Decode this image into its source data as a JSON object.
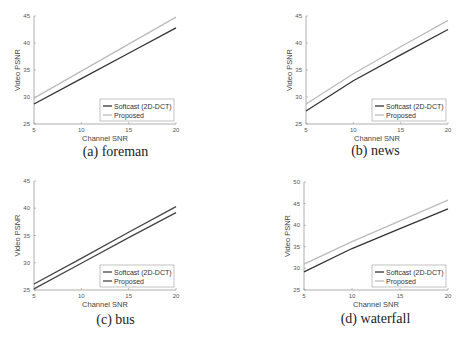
{
  "chart_data": [
    {
      "type": "line",
      "caption": "(a) foreman",
      "xlabel": "Channel SNR",
      "ylabel": "Video PSNR",
      "xlim": [
        5,
        20
      ],
      "ylim": [
        25,
        45
      ],
      "xticks": [
        5,
        10,
        15,
        20
      ],
      "yticks": [
        25,
        30,
        35,
        40,
        45
      ],
      "grid": false,
      "legend_position": "lower right",
      "x": [
        5,
        10,
        15,
        20
      ],
      "series": [
        {
          "name": "Softcast (2D-DCT)",
          "color": "#333333",
          "values": [
            28.7,
            33.4,
            38.1,
            42.8
          ]
        },
        {
          "name": "Proposed",
          "color": "#bbbbbb",
          "values": [
            29.8,
            34.8,
            39.8,
            44.8
          ]
        }
      ]
    },
    {
      "type": "line",
      "caption": "(b) news",
      "xlabel": "Channel SNR",
      "ylabel": "Video PSNR",
      "xlim": [
        5,
        20
      ],
      "ylim": [
        25,
        45
      ],
      "xticks": [
        5,
        10,
        15,
        20
      ],
      "yticks": [
        25,
        30,
        35,
        40,
        45
      ],
      "grid": false,
      "legend_position": "lower right",
      "x": [
        5,
        10,
        15,
        20
      ],
      "series": [
        {
          "name": "Softcast (2D-DCT)",
          "color": "#333333",
          "values": [
            27.4,
            33.0,
            37.8,
            42.5
          ]
        },
        {
          "name": "Proposed",
          "color": "#bbbbbb",
          "values": [
            28.7,
            34.3,
            39.3,
            44.2
          ]
        }
      ]
    },
    {
      "type": "line",
      "caption": "(c) bus",
      "xlabel": "Channel SNR",
      "ylabel": "Video PSNR",
      "xlim": [
        5,
        20
      ],
      "ylim": [
        25,
        45
      ],
      "xticks": [
        5,
        10,
        15,
        20
      ],
      "yticks": [
        25,
        30,
        35,
        40,
        45
      ],
      "grid": false,
      "legend_position": "lower right",
      "x": [
        5,
        10,
        15,
        20
      ],
      "series": [
        {
          "name": "Softcast (2D-DCT)",
          "color": "#444444",
          "values": [
            26.1,
            30.8,
            35.6,
            40.3
          ]
        },
        {
          "name": "Proposed",
          "color": "#444444",
          "values": [
            25.2,
            29.9,
            34.6,
            39.2
          ]
        }
      ]
    },
    {
      "type": "line",
      "caption": "(d) waterfall",
      "xlabel": "Channel SNR",
      "ylabel": "Video PSNR",
      "xlim": [
        5,
        20
      ],
      "ylim": [
        25,
        50
      ],
      "xticks": [
        5,
        10,
        15,
        20
      ],
      "yticks": [
        25,
        30,
        35,
        40,
        45,
        50
      ],
      "grid": false,
      "legend_position": "lower right",
      "x": [
        5,
        10,
        15,
        20
      ],
      "series": [
        {
          "name": "Softcast (2D-DCT)",
          "color": "#333333",
          "values": [
            29.2,
            34.6,
            39.2,
            43.8
          ]
        },
        {
          "name": "Proposed",
          "color": "#bbbbbb",
          "values": [
            31.0,
            36.2,
            41.0,
            45.8
          ]
        }
      ]
    }
  ],
  "panels": [
    {
      "caption": "(a) foreman"
    },
    {
      "caption": "(b) news"
    },
    {
      "caption": "(c) bus"
    },
    {
      "caption": "(d) waterfall"
    }
  ]
}
